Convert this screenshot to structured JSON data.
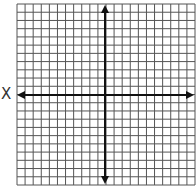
{
  "diagram": {
    "type": "coordinate-grid",
    "x_axis_label": "X",
    "columns": 22,
    "rows": 22,
    "grid": {
      "left": 17,
      "top": 4,
      "right": 195,
      "bottom": 185
    },
    "origin": {
      "x": 105,
      "y": 95
    },
    "colors": {
      "grid_line": "#555555",
      "axis": "#111111",
      "label": "#333333",
      "background": "#ffffff"
    }
  }
}
